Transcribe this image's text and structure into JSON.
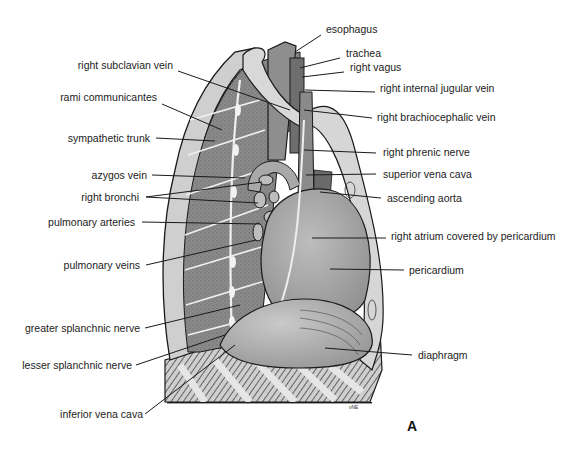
{
  "figure": {
    "panel_letter": "A",
    "artist_signature": "vNE",
    "colors": {
      "background": "#ffffff",
      "ink": "#1a1a1a",
      "wall_dark": "#7d7d7d",
      "wall_mid": "#9a9a9a",
      "organ": "#a8a8a8",
      "organ_light": "#c4c4c4",
      "bone": "#d6d6d6"
    }
  },
  "labels_left": [
    {
      "id": "right-subclavian-vein",
      "text": "right subclavian vein"
    },
    {
      "id": "rami-communicantes",
      "text": "rami communicantes"
    },
    {
      "id": "sympathetic-trunk",
      "text": "sympathetic trunk"
    },
    {
      "id": "azygos-vein",
      "text": "azygos vein"
    },
    {
      "id": "right-bronchi",
      "text": "right bronchi"
    },
    {
      "id": "pulmonary-arteries",
      "text": "pulmonary arteries"
    },
    {
      "id": "pulmonary-veins",
      "text": "pulmonary veins"
    },
    {
      "id": "greater-splanchnic-nerve",
      "text": "greater splanchnic nerve"
    },
    {
      "id": "lesser-splanchnic-nerve",
      "text": "lesser splanchnic nerve"
    },
    {
      "id": "inferior-vena-cava",
      "text": "inferior vena cava"
    }
  ],
  "labels_right": [
    {
      "id": "esophagus",
      "text": "esophagus"
    },
    {
      "id": "trachea",
      "text": "trachea"
    },
    {
      "id": "right-vagus",
      "text": "right vagus"
    },
    {
      "id": "right-internal-jugular-vein",
      "text": "right internal jugular vein"
    },
    {
      "id": "right-brachiocephalic-vein",
      "text": "right brachiocephalic vein"
    },
    {
      "id": "right-phrenic-nerve",
      "text": "right phrenic nerve"
    },
    {
      "id": "superior-vena-cava",
      "text": "superior vena cava"
    },
    {
      "id": "ascending-aorta",
      "text": "ascending aorta"
    },
    {
      "id": "right-atrium-covered-by-pericardium",
      "text": "right atrium covered by pericardium"
    },
    {
      "id": "pericardium",
      "text": "pericardium"
    },
    {
      "id": "diaphragm",
      "text": "diaphragm"
    }
  ]
}
